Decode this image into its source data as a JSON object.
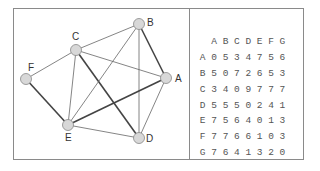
{
  "graph": {
    "nodes": [
      {
        "id": "A",
        "label": "A",
        "x": 166,
        "y": 78,
        "lx": 175,
        "ly": 82
      },
      {
        "id": "B",
        "label": "B",
        "x": 139,
        "y": 24,
        "lx": 147,
        "ly": 26
      },
      {
        "id": "C",
        "label": "C",
        "x": 76,
        "y": 50,
        "lx": 72,
        "ly": 40
      },
      {
        "id": "D",
        "label": "D",
        "x": 139,
        "y": 138,
        "lx": 146,
        "ly": 142
      },
      {
        "id": "E",
        "label": "E",
        "x": 68,
        "y": 125,
        "lx": 65,
        "ly": 141
      },
      {
        "id": "F",
        "label": "F",
        "x": 26,
        "y": 79,
        "lx": 28,
        "ly": 71
      }
    ],
    "edges": [
      {
        "from": "C",
        "to": "B",
        "weight": "thin"
      },
      {
        "from": "C",
        "to": "F",
        "weight": "thin"
      },
      {
        "from": "C",
        "to": "A",
        "weight": "thin"
      },
      {
        "from": "C",
        "to": "E",
        "weight": "thin"
      },
      {
        "from": "C",
        "to": "D",
        "weight": "thick"
      },
      {
        "from": "B",
        "to": "E",
        "weight": "thin"
      },
      {
        "from": "B",
        "to": "D",
        "weight": "thin"
      },
      {
        "from": "B",
        "to": "A",
        "weight": "thick"
      },
      {
        "from": "F",
        "to": "E",
        "weight": "thick"
      },
      {
        "from": "E",
        "to": "A",
        "weight": "thick"
      },
      {
        "from": "E",
        "to": "D",
        "weight": "thin"
      },
      {
        "from": "A",
        "to": "D",
        "weight": "thin"
      }
    ],
    "colors": {
      "node_fill": "#d8d8d8",
      "node_stroke": "#888888",
      "edge": "#666666",
      "thick_edge": "#444444",
      "label": "#333333"
    }
  },
  "matrix": {
    "headers": [
      "",
      "A",
      "B",
      "C",
      "D",
      "E",
      "F",
      "G"
    ],
    "rows": [
      [
        "A",
        "0",
        "5",
        "3",
        "4",
        "7",
        "5",
        "6"
      ],
      [
        "B",
        "5",
        "0",
        "7",
        "2",
        "6",
        "5",
        "3"
      ],
      [
        "C",
        "3",
        "4",
        "0",
        "9",
        "7",
        "7",
        "7"
      ],
      [
        "D",
        "5",
        "5",
        "5",
        "0",
        "2",
        "4",
        "1"
      ],
      [
        "E",
        "7",
        "5",
        "6",
        "4",
        "0",
        "1",
        "3"
      ],
      [
        "F",
        "7",
        "7",
        "6",
        "6",
        "1",
        "0",
        "3"
      ],
      [
        "G",
        "7",
        "6",
        "4",
        "1",
        "3",
        "2",
        "0"
      ]
    ]
  }
}
